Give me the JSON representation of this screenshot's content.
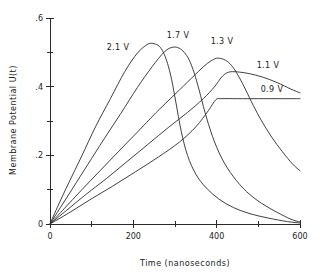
{
  "chart_data": {
    "type": "line",
    "title": "",
    "xlabel": "Time (nanoseconds)",
    "ylabel": "Membrane Potential  U(t)",
    "xlim": [
      0,
      600
    ],
    "ylim": [
      0,
      0.6
    ],
    "grid": false,
    "legend_position": "inline-annotations",
    "x_ticks": [
      0,
      200,
      400,
      600
    ],
    "x_tick_labels": [
      "0",
      "200",
      "400",
      "600"
    ],
    "x_minor_ticks": [
      100,
      300,
      500
    ],
    "y_ticks": [
      0,
      0.2,
      0.4,
      0.6
    ],
    "y_tick_labels": [
      "0",
      ".2",
      ".4",
      ".6"
    ],
    "y_minor_ticks": [
      0.1,
      0.3,
      0.5
    ],
    "series": [
      {
        "name": "2.1 V",
        "label": "2.1 V",
        "label_x": 118,
        "label_y": 50,
        "peak_x": 240,
        "peak_y": 0.525,
        "x": [
          0,
          20,
          45,
          75,
          110,
          145,
          180,
          210,
          235,
          250,
          262,
          272,
          282,
          292,
          302,
          315,
          330,
          350,
          375,
          405,
          440,
          480,
          525,
          570,
          600
        ],
        "values": [
          0.0,
          0.055,
          0.12,
          0.195,
          0.285,
          0.365,
          0.445,
          0.498,
          0.524,
          0.525,
          0.518,
          0.5,
          0.468,
          0.42,
          0.355,
          0.27,
          0.2,
          0.145,
          0.105,
          0.073,
          0.048,
          0.03,
          0.017,
          0.007,
          0.003
        ]
      },
      {
        "name": "1.7 V",
        "label": "1.7 V",
        "label_x": 178,
        "label_y": 38,
        "peak_x": 295,
        "peak_y": 0.515,
        "x": [
          0,
          25,
          55,
          90,
          130,
          170,
          210,
          245,
          275,
          295,
          310,
          322,
          334,
          346,
          358,
          372,
          390,
          412,
          440,
          472,
          508,
          545,
          578,
          600
        ],
        "values": [
          0.0,
          0.048,
          0.105,
          0.172,
          0.248,
          0.322,
          0.398,
          0.458,
          0.502,
          0.515,
          0.512,
          0.5,
          0.478,
          0.44,
          0.39,
          0.325,
          0.255,
          0.192,
          0.138,
          0.094,
          0.06,
          0.034,
          0.014,
          0.006
        ]
      },
      {
        "name": "1.3 V",
        "label": "1.3 V",
        "label_x": 222,
        "label_y": 44,
        "peak_x": 400,
        "peak_y": 0.482,
        "x": [
          0,
          35,
          75,
          120,
          165,
          210,
          255,
          300,
          340,
          372,
          395,
          410,
          425,
          440,
          455,
          470,
          488,
          508,
          532,
          558,
          582,
          600
        ],
        "values": [
          0.0,
          0.046,
          0.098,
          0.155,
          0.212,
          0.268,
          0.325,
          0.378,
          0.425,
          0.462,
          0.481,
          0.482,
          0.474,
          0.455,
          0.425,
          0.39,
          0.345,
          0.3,
          0.253,
          0.21,
          0.175,
          0.155
        ]
      },
      {
        "name": "1.1 V",
        "label": "1.1 V",
        "label_x": 268,
        "label_y": 68,
        "peak_x": 420,
        "peak_y": 0.443,
        "x": [
          0,
          40,
          85,
          135,
          185,
          235,
          285,
          330,
          368,
          395,
          412,
          428,
          450,
          478,
          510,
          545,
          578,
          600
        ],
        "values": [
          0.0,
          0.04,
          0.085,
          0.132,
          0.182,
          0.232,
          0.282,
          0.325,
          0.365,
          0.4,
          0.428,
          0.442,
          0.443,
          0.438,
          0.428,
          0.412,
          0.393,
          0.382
        ]
      },
      {
        "name": "0.9 V",
        "label": "0.9 V",
        "label_x": 272,
        "label_y": 92,
        "peak_x": 400,
        "peak_y": 0.365,
        "x": [
          0,
          45,
          95,
          150,
          205,
          260,
          310,
          350,
          380,
          398,
          410,
          450,
          500,
          550,
          600
        ],
        "values": [
          0.0,
          0.032,
          0.07,
          0.11,
          0.152,
          0.195,
          0.238,
          0.283,
          0.33,
          0.362,
          0.365,
          0.365,
          0.365,
          0.365,
          0.365
        ]
      }
    ]
  }
}
